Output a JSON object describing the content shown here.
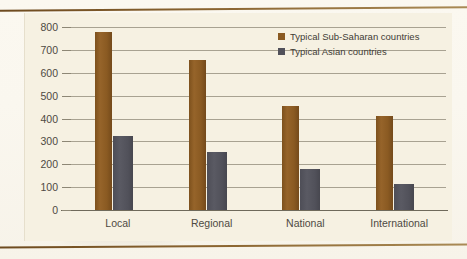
{
  "chart_data": {
    "type": "bar",
    "title": "",
    "xlabel": "",
    "ylabel": "",
    "categories": [
      "Local",
      "Regional",
      "National",
      "International"
    ],
    "series": [
      {
        "name": "Typical Sub-Saharan countries",
        "color": "#8a5a22",
        "values": [
          780,
          655,
          455,
          410
        ]
      },
      {
        "name": "Typical Asian countries",
        "color": "#51515a",
        "values": [
          325,
          255,
          180,
          115
        ]
      }
    ],
    "ylim": [
      0,
      800
    ],
    "yticks": [
      0,
      100,
      200,
      300,
      400,
      500,
      600,
      700,
      800
    ],
    "ytick_labels": [
      "0",
      "100",
      "200",
      "300",
      "400",
      "500",
      "600",
      "700",
      "800"
    ],
    "grid": true,
    "legend_position": "top-right"
  },
  "legend": {
    "items": [
      {
        "label": "Typical Sub-Saharan countries"
      },
      {
        "label": "Typical Asian countries"
      }
    ]
  },
  "colors": {
    "series_sub_saharan": "#8a5a22",
    "series_asian": "#51515a",
    "panel_background": "#f6f1e2",
    "page_background": "#faf7ef",
    "rule": "#8a6430",
    "gridline": "#8d8775",
    "text": "#4e4a42"
  }
}
